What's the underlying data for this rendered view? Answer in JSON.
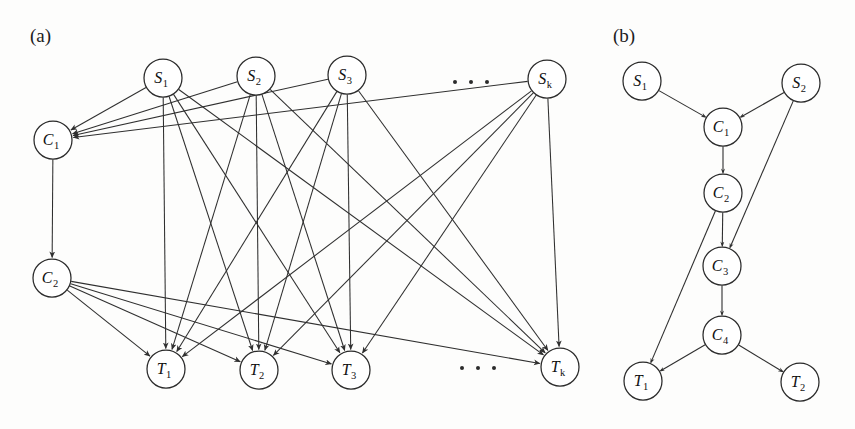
{
  "figure": {
    "panels": [
      {
        "id": "panel-a",
        "label": "(a)",
        "label_x": 30,
        "label_y": 42,
        "nodes": [
          {
            "id": "a-S1",
            "base": "S",
            "sub": "1",
            "x": 163,
            "y": 78,
            "r": 19
          },
          {
            "id": "a-S2",
            "base": "S",
            "sub": "2",
            "x": 256,
            "y": 76,
            "r": 19
          },
          {
            "id": "a-S3",
            "base": "S",
            "sub": "3",
            "x": 347,
            "y": 75,
            "r": 19
          },
          {
            "id": "a-Sk",
            "base": "S",
            "sub": "k",
            "x": 547,
            "y": 79,
            "r": 19
          },
          {
            "id": "a-C1",
            "base": "C",
            "sub": "1",
            "x": 53,
            "y": 140,
            "r": 19
          },
          {
            "id": "a-C2",
            "base": "C",
            "sub": "2",
            "x": 52,
            "y": 278,
            "r": 19
          },
          {
            "id": "a-T1",
            "base": "T",
            "sub": "1",
            "x": 166,
            "y": 369,
            "r": 19
          },
          {
            "id": "a-T2",
            "base": "T",
            "sub": "2",
            "x": 259,
            "y": 370,
            "r": 19
          },
          {
            "id": "a-T3",
            "base": "T",
            "sub": "3",
            "x": 351,
            "y": 370,
            "r": 19
          },
          {
            "id": "a-Tk",
            "base": "T",
            "sub": "k",
            "x": 560,
            "y": 367,
            "r": 19
          }
        ],
        "edges": [
          {
            "from": "a-S1",
            "to": "a-C1"
          },
          {
            "from": "a-S2",
            "to": "a-C1"
          },
          {
            "from": "a-S3",
            "to": "a-C1"
          },
          {
            "from": "a-Sk",
            "to": "a-C1"
          },
          {
            "from": "a-C1",
            "to": "a-C2"
          },
          {
            "from": "a-C2",
            "to": "a-T1"
          },
          {
            "from": "a-C2",
            "to": "a-T2"
          },
          {
            "from": "a-C2",
            "to": "a-T3"
          },
          {
            "from": "a-C2",
            "to": "a-Tk"
          },
          {
            "from": "a-S1",
            "to": "a-T1"
          },
          {
            "from": "a-S1",
            "to": "a-T2"
          },
          {
            "from": "a-S1",
            "to": "a-T3"
          },
          {
            "from": "a-S1",
            "to": "a-Tk"
          },
          {
            "from": "a-S2",
            "to": "a-T1"
          },
          {
            "from": "a-S2",
            "to": "a-T2"
          },
          {
            "from": "a-S2",
            "to": "a-T3"
          },
          {
            "from": "a-S2",
            "to": "a-Tk"
          },
          {
            "from": "a-S3",
            "to": "a-T1"
          },
          {
            "from": "a-S3",
            "to": "a-T2"
          },
          {
            "from": "a-S3",
            "to": "a-T3"
          },
          {
            "from": "a-S3",
            "to": "a-Tk"
          },
          {
            "from": "a-Sk",
            "to": "a-T1"
          },
          {
            "from": "a-Sk",
            "to": "a-T2"
          },
          {
            "from": "a-Sk",
            "to": "a-T3"
          },
          {
            "from": "a-Sk",
            "to": "a-Tk"
          }
        ],
        "ellipses": [
          {
            "id": "a-ellipsis-top",
            "x": 455,
            "y": 82,
            "dots": 3,
            "gap": 16
          },
          {
            "id": "a-ellipsis-bottom",
            "x": 462,
            "y": 368,
            "dots": 3,
            "gap": 16
          }
        ]
      },
      {
        "id": "panel-b",
        "label": "(b)",
        "label_x": 613,
        "label_y": 42,
        "nodes": [
          {
            "id": "b-S1",
            "base": "S",
            "sub": "1",
            "x": 642,
            "y": 81,
            "r": 19
          },
          {
            "id": "b-S2",
            "base": "S",
            "sub": "2",
            "x": 801,
            "y": 83,
            "r": 19
          },
          {
            "id": "b-C1",
            "base": "C",
            "sub": "1",
            "x": 723,
            "y": 127,
            "r": 19
          },
          {
            "id": "b-C2",
            "base": "C",
            "sub": "2",
            "x": 723,
            "y": 193,
            "r": 19
          },
          {
            "id": "b-C3",
            "base": "C",
            "sub": "3",
            "x": 722,
            "y": 266,
            "r": 19
          },
          {
            "id": "b-C4",
            "base": "C",
            "sub": "4",
            "x": 722,
            "y": 335,
            "r": 19
          },
          {
            "id": "b-T1",
            "base": "T",
            "sub": "1",
            "x": 643,
            "y": 381,
            "r": 19
          },
          {
            "id": "b-T2",
            "base": "T",
            "sub": "2",
            "x": 800,
            "y": 382,
            "r": 19
          }
        ],
        "edges": [
          {
            "from": "b-S1",
            "to": "b-C1"
          },
          {
            "from": "b-S2",
            "to": "b-C1"
          },
          {
            "from": "b-C1",
            "to": "b-C2"
          },
          {
            "from": "b-C2",
            "to": "b-C3"
          },
          {
            "from": "b-S2",
            "to": "b-C3"
          },
          {
            "from": "b-C3",
            "to": "b-C4"
          },
          {
            "from": "b-C2",
            "to": "b-T1"
          },
          {
            "from": "b-C4",
            "to": "b-T1"
          },
          {
            "from": "b-C4",
            "to": "b-T2"
          }
        ],
        "ellipses": []
      }
    ]
  }
}
